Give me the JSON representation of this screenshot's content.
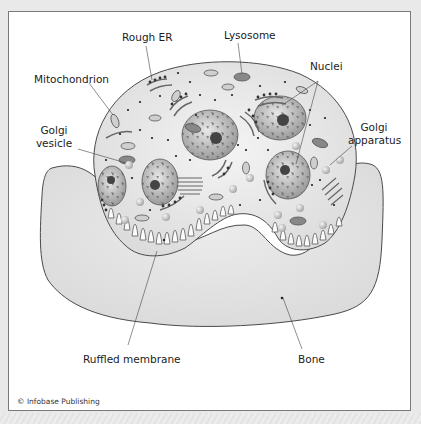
{
  "figure": {
    "labels": {
      "rough_er": "Rough ER",
      "lysosome": "Lysosome",
      "mitochondrion": "Mitochondrion",
      "nuclei": "Nuclei",
      "golgi_vesicle_line1": "Golgi",
      "golgi_vesicle_line2": "vesicle",
      "golgi_apparatus_line1": "Golgi",
      "golgi_apparatus_line2": "apparatus",
      "ruffled_membrane": "Ruffled membrane",
      "bone": "Bone"
    },
    "credit": "© Infobase Publishing"
  },
  "colors": {
    "background": "#e9e9e9",
    "frame": "#ffffff",
    "bone_fill": "#e3e3e3",
    "cell_fill": "#ededed",
    "outline": "#555555",
    "organelle_dark": "#5a5a5a"
  }
}
